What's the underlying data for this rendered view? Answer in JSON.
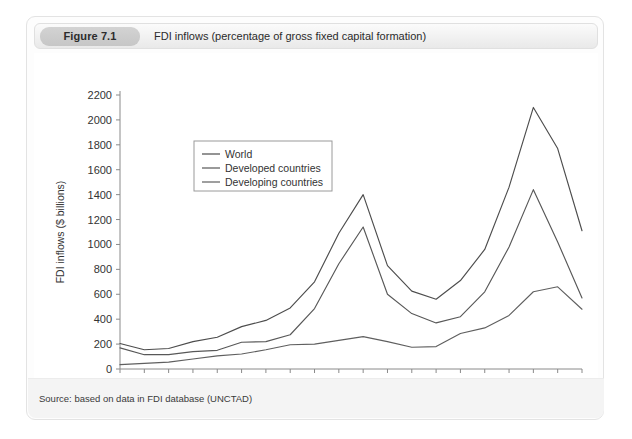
{
  "figure": {
    "badge": "Figure 7.1",
    "caption": "FDI inflows (percentage of gross fixed capital formation)",
    "source": "Source: based on data in FDI database (UNCTAD)"
  },
  "chart_data": {
    "type": "line",
    "title": "FDI inflows (percentage of gross fixed capital formation)",
    "xlabel": "",
    "ylabel": "FDI inflows ($ billions)",
    "x": [
      1990,
      1991,
      1992,
      1993,
      1994,
      1995,
      1996,
      1997,
      1998,
      1999,
      2000,
      2001,
      2002,
      2003,
      2004,
      2005,
      2006,
      2007,
      2008,
      2009
    ],
    "xlim": [
      1990,
      2009
    ],
    "ylim": [
      0,
      2200
    ],
    "xticks": [
      1990,
      1991,
      1992,
      1993,
      1994,
      1995,
      1996,
      1997,
      1998,
      1999,
      2000,
      2001,
      2002,
      2003,
      2004,
      2005,
      2006,
      2007,
      2008,
      2009
    ],
    "xtick_labels": [
      "1990",
      "",
      "1992",
      "",
      "1994",
      "",
      "1996",
      "",
      "1998",
      "",
      "2000",
      "",
      "2002",
      "",
      "2004",
      "",
      "2006",
      "",
      "2008",
      ""
    ],
    "yticks": [
      0,
      200,
      400,
      600,
      800,
      1000,
      1200,
      1400,
      1600,
      1800,
      2000,
      2200
    ],
    "ytick_labels": [
      "0",
      "200",
      "400",
      "600",
      "800",
      "1000",
      "1200",
      "1400",
      "1600",
      "1800",
      "2000",
      "2200"
    ],
    "grid": false,
    "legend_position": "upper left",
    "series": [
      {
        "name": "World",
        "color": "#4d4d4d",
        "values": [
          205,
          155,
          165,
          220,
          255,
          340,
          390,
          490,
          700,
          1090,
          1400,
          830,
          625,
          560,
          710,
          960,
          1460,
          2100,
          1770,
          1110
        ]
      },
      {
        "name": "Developed countries",
        "color": "#585858",
        "values": [
          170,
          115,
          115,
          140,
          150,
          215,
          220,
          275,
          485,
          845,
          1140,
          600,
          445,
          370,
          420,
          620,
          980,
          1440,
          1020,
          570
        ]
      },
      {
        "name": "Developing countries",
        "color": "#5f5f5f",
        "values": [
          35,
          45,
          55,
          80,
          105,
          120,
          155,
          195,
          200,
          230,
          260,
          220,
          175,
          180,
          285,
          330,
          430,
          620,
          660,
          480
        ]
      }
    ]
  }
}
